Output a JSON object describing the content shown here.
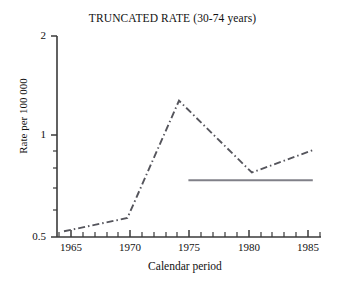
{
  "chart_data": {
    "type": "line",
    "title": "TRUNCATED RATE (30-74 years)",
    "xlabel": "Calendar period",
    "ylabel": "Rate per 100 000",
    "yscale": "log",
    "ylim": [
      0.5,
      2
    ],
    "xlim": [
      1964,
      1986.5
    ],
    "grid": false,
    "legend": "none",
    "y_tick_labels": [
      "2",
      "1",
      "0.5"
    ],
    "y_tick_values": [
      2,
      1,
      0.5
    ],
    "y_minor_ticks": [
      0.6,
      0.7,
      0.8,
      0.9
    ],
    "x_tick_labels": [
      "1965",
      "1970",
      "1975",
      "1980",
      "1985"
    ],
    "x_tick_values": [
      1965,
      1970,
      1975,
      1980,
      1985
    ],
    "x_minor_ticks": [
      1964,
      1966,
      1967,
      1968,
      1969,
      1971,
      1972,
      1973,
      1974,
      1976,
      1977,
      1978,
      1979,
      1981,
      1982,
      1983,
      1984,
      1986
    ],
    "series": [
      {
        "name": "observed-rate",
        "style": "dash-dot",
        "color": "#55555c",
        "x": [
          1964.6,
          1970.0,
          1974.4,
          1980.6,
          1985.8
        ],
        "values": [
          0.52,
          0.57,
          1.28,
          0.78,
          0.91
        ]
      },
      {
        "name": "fitted-level",
        "style": "solid",
        "color": "#808088",
        "x": [
          1975.2,
          1985.8
        ],
        "values": [
          0.74,
          0.74
        ]
      }
    ]
  }
}
